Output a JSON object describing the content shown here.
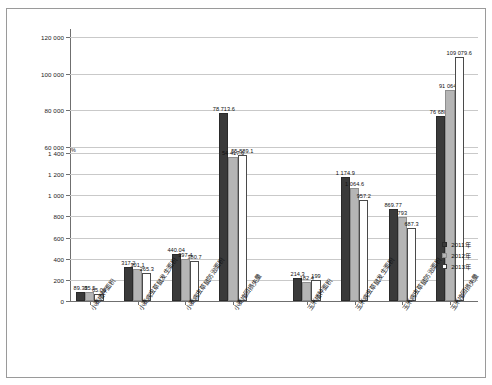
{
  "chart_data": {
    "type": "bar",
    "title": "",
    "xlabel": "",
    "ylabel": "",
    "unit_mark": "%",
    "grid": true,
    "legend_position": "right",
    "axis_note": "broken y-axis: lower segment 0-1400, upper segment 60000-120000",
    "y_ticks_lower": [
      "0",
      "200",
      "400",
      "600",
      "800",
      "1 000",
      "1 200",
      "1 400"
    ],
    "y_ticks_upper": [
      "60 000",
      "80 000",
      "100 000",
      "120 000"
    ],
    "ylim_lower": [
      0,
      1400
    ],
    "ylim_upper": [
      60000,
      120000
    ],
    "categories": [
      "小麦播种面积",
      "小麦病虫草鼠发生面积",
      "小麦病虫草鼠防治面积",
      "小麦挽回损失量",
      "玉米播种面积",
      "玉米病虫草鼠发生面积",
      "玉米病虫草鼠防治面积",
      "玉米挽回损失量"
    ],
    "series": [
      {
        "name": "2011年",
        "color": "#3a3a3a",
        "values": [
          89.33,
          317.2,
          440.04,
          78713.6,
          214.3,
          1174.9,
          869.77,
          76680.2
        ],
        "labels": [
          "89.33",
          "317.2",
          "440.04",
          "78 713.6",
          "214.3",
          "1 174.9",
          "869.77",
          "76 680.2"
        ]
      },
      {
        "name": "2012年",
        "color": "#b5b5b5",
        "values": [
          85.5,
          301.1,
          397.4,
          54417.6,
          182.4,
          1064.6,
          793,
          91064.2
        ],
        "labels": [
          "85.5",
          "301.1",
          "397.4",
          "54 417.6",
          "182.4",
          "1 064.6",
          "793",
          "91 064.2"
        ]
      },
      {
        "name": "2013年",
        "color": "#ffffff",
        "values": [
          65.09,
          265.3,
          380.7,
          55889.1,
          199,
          957.2,
          687.3,
          109079.6
        ],
        "labels": [
          "65.09",
          "265.3",
          "380.7",
          "55 889.1",
          "199",
          "957.2",
          "687.3",
          "109 079.6"
        ]
      }
    ]
  },
  "legend": {
    "items": [
      {
        "label": "2011年"
      },
      {
        "label": "2012年"
      },
      {
        "label": "2013年"
      }
    ]
  }
}
